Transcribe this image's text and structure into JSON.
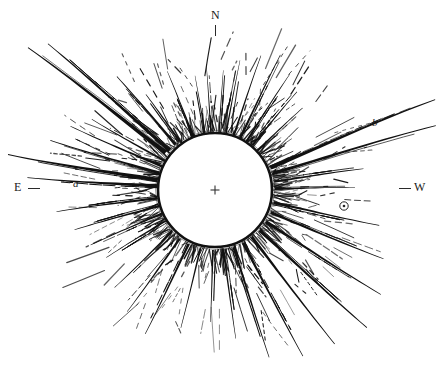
{
  "figure": {
    "type": "astronomical-drawing",
    "background_color": "#ffffff",
    "ink_color": "#111111"
  },
  "canvas": {
    "width": 440,
    "height": 367
  },
  "occulting_disk": {
    "name": "moon-disk",
    "center_x": 215,
    "center_y": 190,
    "radius": 57,
    "fill": "#ffffff",
    "stroke": "#111111",
    "stroke_width": 2.6
  },
  "center_marker": {
    "name": "center-cross",
    "symbol": "+",
    "x": 215,
    "y": 190,
    "size": 9
  },
  "star_marker": {
    "name": "star-symbol",
    "symbol": "⊙",
    "x": 344,
    "y": 206,
    "outer_radius": 4.2,
    "inner_radius": 1.3
  },
  "cardinal_labels": [
    {
      "id": "n",
      "label": "N",
      "x": 211,
      "y": 9,
      "tick": "vertical"
    },
    {
      "id": "e",
      "label": "E",
      "x": 14,
      "y": 181,
      "tick": "horizontal-right"
    },
    {
      "id": "w",
      "label": "W",
      "x": 414,
      "y": 181,
      "tick": "horizontal-left"
    }
  ],
  "streamer_labels": [
    {
      "id": "a",
      "label": "a",
      "x": 73,
      "y": 178,
      "style": "italic"
    },
    {
      "id": "b",
      "label": "b",
      "x": 372,
      "y": 117,
      "style": "italic"
    }
  ],
  "chart_data": {
    "type": "scatter",
    "title": "",
    "xlabel": "",
    "ylabel": "",
    "orientation": {
      "north": "top",
      "east": "left",
      "west": "right"
    },
    "disk": {
      "cx": 215,
      "cy": 190,
      "r": 57
    },
    "solid_streamers": [
      {
        "name": "NE-long-upper",
        "angle_deg": 143,
        "start_r": 62,
        "end_r": 235,
        "width_in": 5.0,
        "width_out": 0.9,
        "bow": -14
      },
      {
        "name": "NE-long-lower",
        "angle_deg": 139,
        "start_r": 60,
        "end_r": 222,
        "width_in": 4.2,
        "width_out": 0.8,
        "bow": -10
      },
      {
        "name": "NE-mid",
        "angle_deg": 131,
        "start_r": 60,
        "end_r": 150,
        "width_in": 3.0,
        "width_out": 0.7,
        "bow": -8
      },
      {
        "name": "NE-short",
        "angle_deg": 126,
        "start_r": 60,
        "end_r": 118,
        "width_in": 2.4,
        "width_out": 0.6,
        "bow": -6
      },
      {
        "name": "NNE-ray-1",
        "angle_deg": 112,
        "start_r": 58,
        "end_r": 128,
        "width_in": 2.0,
        "width_out": 0.5,
        "bow": -5
      },
      {
        "name": "N-polar-1",
        "angle_deg": 100,
        "start_r": 58,
        "end_r": 116,
        "width_in": 1.5,
        "width_out": 0.4,
        "bow": -3
      },
      {
        "name": "N-polar-2",
        "angle_deg": 94,
        "start_r": 58,
        "end_r": 126,
        "width_in": 1.6,
        "width_out": 0.4,
        "bow": -2
      },
      {
        "name": "N-polar-3",
        "angle_deg": 86,
        "start_r": 58,
        "end_r": 120,
        "width_in": 1.5,
        "width_out": 0.4,
        "bow": 2
      },
      {
        "name": "N-polar-4",
        "angle_deg": 79,
        "start_r": 58,
        "end_r": 132,
        "width_in": 1.8,
        "width_out": 0.4,
        "bow": 4
      },
      {
        "name": "NW-brush-1",
        "angle_deg": 71,
        "start_r": 58,
        "end_r": 142,
        "width_in": 2.2,
        "width_out": 0.5,
        "bow": 6
      },
      {
        "name": "NW-brush-2",
        "angle_deg": 64,
        "start_r": 58,
        "end_r": 150,
        "width_in": 2.6,
        "width_out": 0.6,
        "bow": 8
      },
      {
        "name": "NW-brush-3",
        "angle_deg": 57,
        "start_r": 58,
        "end_r": 138,
        "width_in": 2.4,
        "width_out": 0.5,
        "bow": 8
      },
      {
        "name": "NW-brush-4",
        "angle_deg": 50,
        "start_r": 58,
        "end_r": 128,
        "width_in": 2.2,
        "width_out": 0.5,
        "bow": 7
      },
      {
        "name": "NW-brush-5",
        "angle_deg": 43,
        "start_r": 58,
        "end_r": 120,
        "width_in": 2.0,
        "width_out": 0.5,
        "bow": 6
      },
      {
        "name": "W-streamer-b-upper",
        "angle_deg": 22,
        "start_r": 60,
        "end_r": 238,
        "width_in": 4.4,
        "width_out": 0.9,
        "bow": 16
      },
      {
        "name": "W-streamer-b-lower",
        "angle_deg": 16,
        "start_r": 60,
        "end_r": 230,
        "width_in": 3.6,
        "width_out": 0.8,
        "bow": 13
      },
      {
        "name": "W-equatorial-1",
        "angle_deg": 8,
        "start_r": 60,
        "end_r": 150,
        "width_in": 2.4,
        "width_out": 0.6,
        "bow": 8
      },
      {
        "name": "W-equatorial-2",
        "angle_deg": 1,
        "start_r": 60,
        "end_r": 140,
        "width_in": 2.0,
        "width_out": 0.5,
        "bow": 5
      },
      {
        "name": "SW-ray-1",
        "angle_deg": -12,
        "start_r": 60,
        "end_r": 168,
        "width_in": 2.8,
        "width_out": 0.6,
        "bow": -8
      },
      {
        "name": "SW-ray-2",
        "angle_deg": -22,
        "start_r": 60,
        "end_r": 182,
        "width_in": 3.2,
        "width_out": 0.7,
        "bow": -10
      },
      {
        "name": "SW-ray-3",
        "angle_deg": -32,
        "start_r": 60,
        "end_r": 196,
        "width_in": 3.4,
        "width_out": 0.7,
        "bow": -10
      },
      {
        "name": "SW-ray-4",
        "angle_deg": -42,
        "start_r": 60,
        "end_r": 205,
        "width_in": 3.6,
        "width_out": 0.8,
        "bow": -9
      },
      {
        "name": "SW-ray-5",
        "angle_deg": -52,
        "start_r": 60,
        "end_r": 195,
        "width_in": 3.2,
        "width_out": 0.7,
        "bow": -7
      },
      {
        "name": "S-ray-1",
        "angle_deg": -62,
        "start_r": 60,
        "end_r": 188,
        "width_in": 3.0,
        "width_out": 0.7,
        "bow": -6
      },
      {
        "name": "S-ray-2",
        "angle_deg": -72,
        "start_r": 60,
        "end_r": 176,
        "width_in": 2.8,
        "width_out": 0.6,
        "bow": -4
      },
      {
        "name": "S-ray-3",
        "angle_deg": -82,
        "start_r": 60,
        "end_r": 150,
        "width_in": 2.2,
        "width_out": 0.5,
        "bow": -2
      },
      {
        "name": "S-ray-4",
        "angle_deg": -92,
        "start_r": 60,
        "end_r": 132,
        "width_in": 1.9,
        "width_out": 0.5,
        "bow": 2
      },
      {
        "name": "SSE-ray-1",
        "angle_deg": -104,
        "start_r": 60,
        "end_r": 142,
        "width_in": 2.0,
        "width_out": 0.5,
        "bow": 4
      },
      {
        "name": "SE-ray-1",
        "angle_deg": -116,
        "start_r": 60,
        "end_r": 160,
        "width_in": 2.6,
        "width_out": 0.6,
        "bow": 7
      },
      {
        "name": "SE-ray-2",
        "angle_deg": -126,
        "start_r": 60,
        "end_r": 150,
        "width_in": 2.4,
        "width_out": 0.6,
        "bow": 8
      },
      {
        "name": "SE-ray-3",
        "angle_deg": -136,
        "start_r": 60,
        "end_r": 140,
        "width_in": 2.2,
        "width_out": 0.5,
        "bow": 8
      },
      {
        "name": "E-streamer-a-main",
        "angle_deg": 170,
        "start_r": 58,
        "end_r": 210,
        "width_in": 4.6,
        "width_out": 0.9,
        "bow": 14
      },
      {
        "name": "E-streamer-a-2",
        "angle_deg": 176,
        "start_r": 58,
        "end_r": 188,
        "width_in": 3.4,
        "width_out": 0.8,
        "bow": 11
      },
      {
        "name": "E-streamer-a-3",
        "angle_deg": 163,
        "start_r": 58,
        "end_r": 172,
        "width_in": 3.0,
        "width_out": 0.7,
        "bow": 10
      },
      {
        "name": "E-streamer-a-4",
        "angle_deg": 156,
        "start_r": 58,
        "end_r": 158,
        "width_in": 2.6,
        "width_out": 0.6,
        "bow": 9
      },
      {
        "name": "E-streamer-a-5",
        "angle_deg": 150,
        "start_r": 58,
        "end_r": 142,
        "width_in": 2.4,
        "width_out": 0.6,
        "bow": 8
      },
      {
        "name": "ESE-ray-1",
        "angle_deg": -172,
        "start_r": 58,
        "end_r": 160,
        "width_in": 2.8,
        "width_out": 0.6,
        "bow": -10
      },
      {
        "name": "ESE-ray-2",
        "angle_deg": -164,
        "start_r": 58,
        "end_r": 146,
        "width_in": 2.4,
        "width_out": 0.6,
        "bow": -9
      },
      {
        "name": "ESE-ray-3",
        "angle_deg": -156,
        "start_r": 58,
        "end_r": 136,
        "width_in": 2.2,
        "width_out": 0.5,
        "bow": -8
      },
      {
        "name": "ESE-ray-4",
        "angle_deg": -148,
        "start_r": 58,
        "end_r": 128,
        "width_in": 2.0,
        "width_out": 0.5,
        "bow": -7
      }
    ],
    "dashed_filament_bands": [
      {
        "name": "inner-filaments",
        "count": 150,
        "r_min": 60,
        "r_max": 118,
        "dash_len": 11,
        "stroke": 0.85
      },
      {
        "name": "outer-filaments",
        "count": 90,
        "r_min": 95,
        "r_max": 200,
        "dash_len": 16,
        "stroke": 0.9
      }
    ]
  }
}
